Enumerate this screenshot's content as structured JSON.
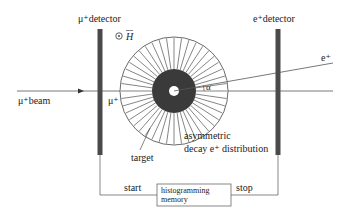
{
  "labels": {
    "mu_detector": "μ⁺detector",
    "e_detector": "e⁺detector",
    "field": "H",
    "field_symbol": "⊙",
    "beam": "μ⁺beam",
    "muon": "μ⁺",
    "positron": "e⁺",
    "angle": "α",
    "target": "target",
    "distribution_line1": "asymmetric",
    "distribution_line2": "decay e⁺ distribution",
    "start": "start",
    "stop": "stop",
    "histogram_line1": "histogramming",
    "histogram_line2": "memory"
  },
  "colors": {
    "detector": "#4a4a4a",
    "target": "#3a3a3a",
    "line": "#555555",
    "text": "#222222"
  }
}
